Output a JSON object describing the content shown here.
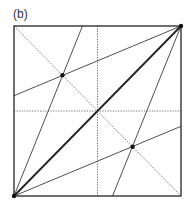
{
  "panel_label": "(b)",
  "diagram": {
    "type": "crease-pattern",
    "square": {
      "x0": 14,
      "y0": 26,
      "x1": 181,
      "y1": 196
    },
    "lines": [
      {
        "name": "main-diagonal",
        "from": [
          0,
          0
        ],
        "to": [
          1,
          1
        ],
        "style": "bold"
      },
      {
        "name": "anti-diagonal",
        "from": [
          0,
          1
        ],
        "to": [
          1,
          0
        ],
        "style": "dotted"
      },
      {
        "name": "vertical-midline",
        "from": [
          0.5,
          0
        ],
        "to": [
          0.5,
          1
        ],
        "style": "dotted"
      },
      {
        "name": "horizontal-midline",
        "from": [
          0,
          0.5
        ],
        "to": [
          1,
          0.5
        ],
        "style": "dotted"
      },
      {
        "name": "crease-bl-top",
        "from": [
          0,
          0
        ],
        "to": [
          0.41,
          1
        ],
        "style": "thin"
      },
      {
        "name": "crease-bl-right",
        "from": [
          0,
          0
        ],
        "to": [
          1,
          0.41
        ],
        "style": "thin"
      },
      {
        "name": "crease-tr-left",
        "from": [
          1,
          1
        ],
        "to": [
          0,
          0.59
        ],
        "style": "thin"
      },
      {
        "name": "crease-tr-bottom",
        "from": [
          1,
          1
        ],
        "to": [
          0.59,
          0
        ],
        "style": "thin"
      }
    ],
    "points": [
      {
        "name": "upper-left-intersection",
        "x": 0.29,
        "y": 0.71
      },
      {
        "name": "lower-right-intersection",
        "x": 0.71,
        "y": 0.29
      },
      {
        "name": "corner-bottom-left",
        "x": 0,
        "y": 0
      },
      {
        "name": "corner-top-right",
        "x": 1,
        "y": 1
      }
    ]
  }
}
